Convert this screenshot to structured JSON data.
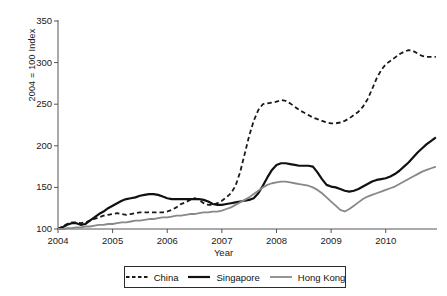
{
  "chart_data": {
    "type": "line",
    "title": "",
    "subtitle": "",
    "xlabel": "Year",
    "ylabel": "2004 = 100 Index",
    "xlim": [
      2004,
      2010.92
    ],
    "ylim": [
      100,
      350
    ],
    "ytick_values": [
      100,
      150,
      200,
      250,
      300,
      350
    ],
    "ytick_labels": [
      "100",
      "150",
      "200",
      "250",
      "300",
      "350"
    ],
    "xtick_values": [
      2004,
      2005,
      2006,
      2007,
      2008,
      2009,
      2010
    ],
    "xtick_labels": [
      "2004",
      "2005",
      "2006",
      "2007",
      "2008",
      "2009",
      "2010"
    ],
    "grid": false,
    "legend_position": "bottom",
    "x": [
      2004.0,
      2004.083,
      2004.167,
      2004.25,
      2004.333,
      2004.417,
      2004.5,
      2004.583,
      2004.667,
      2004.75,
      2004.833,
      2004.917,
      2005.0,
      2005.083,
      2005.167,
      2005.25,
      2005.333,
      2005.417,
      2005.5,
      2005.583,
      2005.667,
      2005.75,
      2005.833,
      2005.917,
      2006.0,
      2006.083,
      2006.167,
      2006.25,
      2006.333,
      2006.417,
      2006.5,
      2006.583,
      2006.667,
      2006.75,
      2006.833,
      2006.917,
      2007.0,
      2007.083,
      2007.167,
      2007.25,
      2007.333,
      2007.417,
      2007.5,
      2007.583,
      2007.667,
      2007.75,
      2007.833,
      2007.917,
      2008.0,
      2008.083,
      2008.167,
      2008.25,
      2008.333,
      2008.417,
      2008.5,
      2008.583,
      2008.667,
      2008.75,
      2008.833,
      2008.917,
      2009.0,
      2009.083,
      2009.167,
      2009.25,
      2009.333,
      2009.417,
      2009.5,
      2009.583,
      2009.667,
      2009.75,
      2009.833,
      2009.917,
      2010.0,
      2010.083,
      2010.167,
      2010.25,
      2010.333,
      2010.417,
      2010.5,
      2010.583,
      2010.667,
      2010.75,
      2010.833,
      2010.917
    ],
    "series": [
      {
        "name": "China",
        "style": "dashed",
        "color": "#1a1a1a",
        "width": 1.8,
        "values": [
          100,
          103,
          106,
          108,
          108,
          107,
          108,
          110,
          112,
          114,
          116,
          117,
          118,
          119,
          118,
          117,
          118,
          119,
          120,
          120,
          120,
          120,
          120,
          120,
          121,
          123,
          126,
          130,
          132,
          135,
          137,
          135,
          131,
          129,
          129,
          131,
          134,
          138,
          143,
          152,
          168,
          190,
          212,
          230,
          243,
          250,
          251,
          252,
          253,
          255,
          254,
          251,
          247,
          243,
          240,
          237,
          234,
          232,
          230,
          228,
          227,
          227,
          228,
          230,
          233,
          237,
          241,
          247,
          256,
          268,
          281,
          291,
          298,
          302,
          306,
          310,
          313,
          315,
          314,
          311,
          308,
          307,
          307,
          307
        ]
      },
      {
        "name": "Singapore",
        "style": "solid",
        "color": "#111111",
        "width": 2.2,
        "values": [
          100,
          102,
          105,
          107,
          107,
          105,
          106,
          110,
          114,
          118,
          121,
          125,
          128,
          131,
          134,
          136,
          137,
          138,
          140,
          141,
          142,
          142,
          141,
          139,
          137,
          136,
          136,
          136,
          136,
          136,
          136,
          136,
          135,
          133,
          130,
          129,
          129,
          130,
          131,
          132,
          133,
          134,
          135,
          137,
          143,
          152,
          162,
          171,
          177,
          179,
          179,
          178,
          177,
          176,
          176,
          176,
          175,
          168,
          160,
          153,
          151,
          150,
          148,
          146,
          145,
          146,
          148,
          151,
          154,
          157,
          159,
          160,
          161,
          163,
          166,
          170,
          175,
          180,
          186,
          192,
          197,
          202,
          206,
          210
        ]
      },
      {
        "name": "Hong Kong",
        "style": "solid",
        "color": "#888888",
        "width": 1.8,
        "values": [
          100,
          100,
          101,
          101,
          102,
          102,
          103,
          103,
          104,
          105,
          105,
          106,
          106,
          107,
          108,
          108,
          109,
          110,
          110,
          111,
          112,
          112,
          113,
          114,
          114,
          115,
          116,
          116,
          117,
          118,
          118,
          119,
          120,
          120,
          121,
          121,
          122,
          124,
          126,
          129,
          132,
          135,
          138,
          142,
          146,
          150,
          153,
          155,
          156,
          157,
          157,
          156,
          155,
          154,
          153,
          152,
          150,
          147,
          143,
          138,
          133,
          128,
          123,
          121,
          124,
          128,
          132,
          136,
          139,
          141,
          143,
          145,
          147,
          149,
          151,
          154,
          157,
          160,
          163,
          166,
          169,
          171,
          173,
          175
        ]
      }
    ]
  },
  "axes": {
    "y_title": "2004 = 100 Index",
    "x_title": "Year"
  },
  "legend": {
    "entries": [
      {
        "label": "China"
      },
      {
        "label": "Singapore"
      },
      {
        "label": "Hong Kong"
      }
    ]
  }
}
